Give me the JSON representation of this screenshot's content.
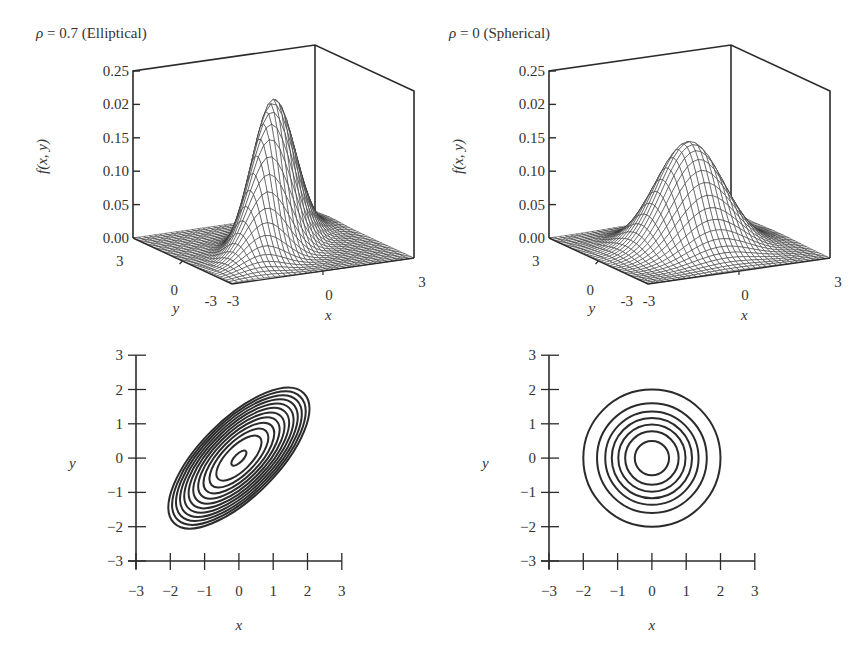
{
  "figure": {
    "panels": [
      {
        "id": "surface-elliptical",
        "title_symbol": "ρ",
        "title_rest": " = 0.7 (Elliptical)"
      },
      {
        "id": "surface-spherical",
        "title_symbol": "ρ",
        "title_rest": " = 0 (Spherical)"
      },
      {
        "id": "contour-elliptical"
      },
      {
        "id": "contour-spherical"
      }
    ]
  },
  "chart_data": [
    {
      "type": "surface3d",
      "title": "ρ = 0.7 (Elliptical)",
      "function": "bivariate normal density f(x, y), μ = (0,0), σx = σy = 1, ρ = 0.7",
      "zlabel": "f(x, y)",
      "xlabel": "x",
      "ylabel": "y",
      "z_ticks": [
        "0.00",
        "0.05",
        "0.10",
        "0.15",
        "0.02",
        "0.25"
      ],
      "x_ticks": [
        "-3",
        "0",
        "3"
      ],
      "y_ticks": [
        "3",
        "0",
        "-3"
      ],
      "xlim": [
        -3,
        3
      ],
      "ylim": [
        -3,
        3
      ],
      "zlim": [
        0,
        0.25
      ],
      "rho": 0.7,
      "peak_value": 0.223,
      "grid": false
    },
    {
      "type": "surface3d",
      "title": "ρ = 0 (Spherical)",
      "function": "bivariate normal density f(x, y), μ = (0,0), σx = σy = 1, ρ = 0",
      "zlabel": "f(x, y)",
      "xlabel": "x",
      "ylabel": "y",
      "z_ticks": [
        "0.00",
        "0.05",
        "0.10",
        "0.15",
        "0.02",
        "0.25"
      ],
      "x_ticks": [
        "-3",
        "0",
        "3"
      ],
      "y_ticks": [
        "3",
        "0",
        "-3"
      ],
      "xlim": [
        -3,
        3
      ],
      "ylim": [
        -3,
        3
      ],
      "zlim": [
        0,
        0.25
      ],
      "rho": 0,
      "peak_value": 0.159,
      "grid": false
    },
    {
      "type": "contour",
      "title": "",
      "xlabel": "x",
      "ylabel": "y",
      "x_ticks": [
        "−3",
        "−2",
        "−1",
        "0",
        "1",
        "2",
        "3"
      ],
      "y_ticks": [
        "−3",
        "−2",
        "−1",
        "0",
        "1",
        "2",
        "3"
      ],
      "xlim": [
        -3,
        3
      ],
      "ylim": [
        -3,
        3
      ],
      "rho": 0.7,
      "contour_count": 12,
      "outer_extent": {
        "x": [
          -2.2,
          2.2
        ],
        "y": [
          -2.2,
          2.2
        ]
      },
      "grid": false
    },
    {
      "type": "contour",
      "title": "",
      "xlabel": "x",
      "ylabel": "y",
      "x_ticks": [
        "−3",
        "−2",
        "−1",
        "0",
        "1",
        "2",
        "3"
      ],
      "y_ticks": [
        "−3",
        "−2",
        "−1",
        "0",
        "1",
        "2",
        "3"
      ],
      "xlim": [
        -3,
        3
      ],
      "ylim": [
        -3,
        3
      ],
      "rho": 0,
      "contour_count": 7,
      "contour_radii": [
        0.5,
        0.78,
        0.98,
        1.17,
        1.36,
        1.6,
        2.0
      ],
      "grid": false
    }
  ],
  "labels": {
    "fxy": "f(x, y)",
    "x": "x",
    "y": "y"
  }
}
